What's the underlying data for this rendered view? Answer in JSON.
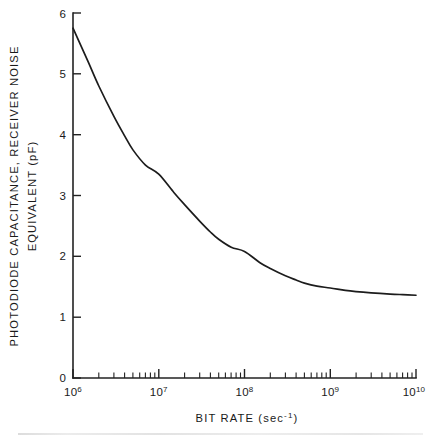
{
  "figure": {
    "background_color": "#ffffff",
    "line_color": "#1c1c1c",
    "axis_color": "#222222"
  },
  "axes": {
    "x_title_main": "BIT RATE (sec",
    "x_title_exp": "-1",
    "x_title_close": ")",
    "x_title_full": "BIT RATE (sec-1)",
    "y_title_line1": "PHOTODIODE  CAPACITANCE,  RECEIVER  NOISE",
    "y_title_line2": "EQUIVALENT  (pF)",
    "x_ticklabels": [
      "10",
      "10",
      "10",
      "10",
      "10"
    ],
    "x_tickexponents": [
      "6",
      "7",
      "8",
      "9",
      "10"
    ],
    "y_ticklabels": [
      "0",
      "1",
      "2",
      "3",
      "4",
      "5",
      "6"
    ]
  },
  "chart_data": {
    "type": "line",
    "title": "",
    "subtitle": "",
    "xlabel": "BIT RATE (sec^-1)",
    "ylabel": "PHOTODIODE CAPACITANCE, RECEIVER NOISE EQUIVALENT (pF)",
    "xscale": "log",
    "yscale": "linear",
    "xlim": [
      1000000,
      10000000000
    ],
    "ylim": [
      0,
      6
    ],
    "xticks": [
      1000000,
      10000000,
      100000000,
      1000000000,
      10000000000
    ],
    "xticklabels": [
      "10^6",
      "10^7",
      "10^8",
      "10^9",
      "10^10"
    ],
    "yticks": [
      0,
      1,
      2,
      3,
      4,
      5,
      6
    ],
    "yticklabels": [
      "0",
      "1",
      "2",
      "3",
      "4",
      "5",
      "6"
    ],
    "grid": false,
    "legend": false,
    "minor_ticks": "log-decade 2-9 on x-axis",
    "series": [
      {
        "name": "photodiode capacitance",
        "x": [
          1000000,
          1500000,
          2000000,
          3000000,
          4000000,
          5000000,
          7000000,
          10000000,
          15000000,
          20000000,
          30000000,
          40000000,
          50000000,
          70000000,
          100000000,
          150000000,
          200000000,
          300000000,
          400000000,
          500000000,
          700000000,
          1000000000,
          1500000000,
          2000000000,
          3000000000,
          5000000000,
          7000000000,
          10000000000
        ],
        "y": [
          5.75,
          5.2,
          4.8,
          4.3,
          3.98,
          3.75,
          3.5,
          3.35,
          3.05,
          2.85,
          2.58,
          2.4,
          2.28,
          2.15,
          2.08,
          1.9,
          1.8,
          1.68,
          1.61,
          1.56,
          1.51,
          1.48,
          1.44,
          1.42,
          1.4,
          1.38,
          1.37,
          1.36
        ]
      }
    ]
  }
}
